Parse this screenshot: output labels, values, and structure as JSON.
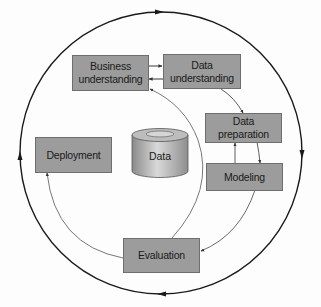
{
  "diagram": {
    "center": {
      "label": "Data",
      "shape": "cylinder"
    },
    "phases": [
      {
        "id": "business",
        "label": "Business understanding",
        "line1": "Business",
        "line2": "understanding"
      },
      {
        "id": "data_understanding",
        "label": "Data understanding",
        "line1": "Data",
        "line2": "understanding"
      },
      {
        "id": "data_preparation",
        "label": "Data preparation",
        "line1": "Data",
        "line2": "preparation"
      },
      {
        "id": "modeling",
        "label": "Modeling"
      },
      {
        "id": "evaluation",
        "label": "Evaluation"
      },
      {
        "id": "deployment",
        "label": "Deployment"
      }
    ],
    "edges": [
      {
        "from": "Business understanding",
        "to": "Data understanding"
      },
      {
        "from": "Data understanding",
        "to": "Business understanding"
      },
      {
        "from": "Data understanding",
        "to": "Data preparation"
      },
      {
        "from": "Data preparation",
        "to": "Modeling"
      },
      {
        "from": "Modeling",
        "to": "Data preparation"
      },
      {
        "from": "Modeling",
        "to": "Evaluation"
      },
      {
        "from": "Evaluation",
        "to": "Business understanding"
      },
      {
        "from": "Evaluation",
        "to": "Deployment"
      }
    ],
    "outer_cycle": {
      "direction": "clockwise"
    },
    "colors": {
      "box_fill": "#9c9c9c",
      "box_border": "#6e6e6e",
      "line": "#1a1a1a",
      "thin_line": "#555555",
      "background": "#fdfdfd"
    }
  }
}
